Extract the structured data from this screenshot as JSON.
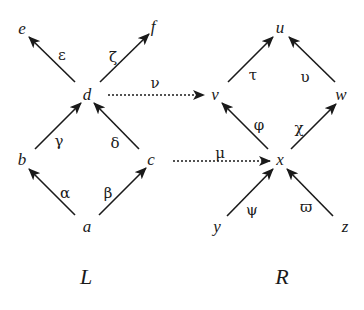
{
  "diagram": {
    "type": "graph-morphism",
    "graphs": [
      {
        "id": "L",
        "label": "L"
      },
      {
        "id": "R",
        "label": "R"
      }
    ],
    "nodes": {
      "e": {
        "label": "e",
        "x": 22,
        "y": 34
      },
      "f": {
        "label": "f",
        "x": 152,
        "y": 32
      },
      "d": {
        "label": "d",
        "x": 87,
        "y": 100
      },
      "b": {
        "label": "b",
        "x": 22,
        "y": 165
      },
      "c": {
        "label": "c",
        "x": 150,
        "y": 165
      },
      "a": {
        "label": "a",
        "x": 87,
        "y": 232
      },
      "u": {
        "label": "u",
        "x": 280,
        "y": 33
      },
      "v": {
        "label": "v",
        "x": 215,
        "y": 100
      },
      "w": {
        "label": "w",
        "x": 340,
        "y": 100
      },
      "x": {
        "label": "x",
        "x": 280,
        "y": 165
      },
      "y": {
        "label": "y",
        "x": 218,
        "y": 232
      },
      "z": {
        "label": "z",
        "x": 345,
        "y": 232
      }
    },
    "edges": [
      {
        "label": "ε",
        "from": "d",
        "to": "e",
        "lx": 62,
        "ly": 60
      },
      {
        "label": "ζ",
        "from": "d",
        "to": "f",
        "lx": 112,
        "ly": 62
      },
      {
        "label": "γ",
        "from": "b",
        "to": "d",
        "lx": 58,
        "ly": 146
      },
      {
        "label": "δ",
        "from": "c",
        "to": "d",
        "lx": 114,
        "ly": 148
      },
      {
        "label": "α",
        "from": "a",
        "to": "b",
        "lx": 64,
        "ly": 198
      },
      {
        "label": "β",
        "from": "a",
        "to": "c",
        "lx": 106,
        "ly": 198
      },
      {
        "label": "τ",
        "from": "v",
        "to": "u",
        "lx": 252,
        "ly": 80
      },
      {
        "label": "υ",
        "from": "w",
        "to": "u",
        "lx": 304,
        "ly": 82
      },
      {
        "label": "φ",
        "from": "x",
        "to": "v",
        "lx": 257,
        "ly": 130
      },
      {
        "label": "χ",
        "from": "x",
        "to": "w",
        "lx": 298,
        "ly": 133
      },
      {
        "label": "ψ",
        "from": "y",
        "to": "x",
        "lx": 250,
        "ly": 215
      },
      {
        "label": "ϖ",
        "from": "z",
        "to": "x",
        "lx": 305,
        "ly": 212
      }
    ],
    "mappings": [
      {
        "label": "ν",
        "from": "d",
        "to": "v",
        "lx": 155,
        "ly": 88
      },
      {
        "label": "μ",
        "from": "c",
        "to": "x",
        "lx": 220,
        "ly": 158
      }
    ]
  }
}
